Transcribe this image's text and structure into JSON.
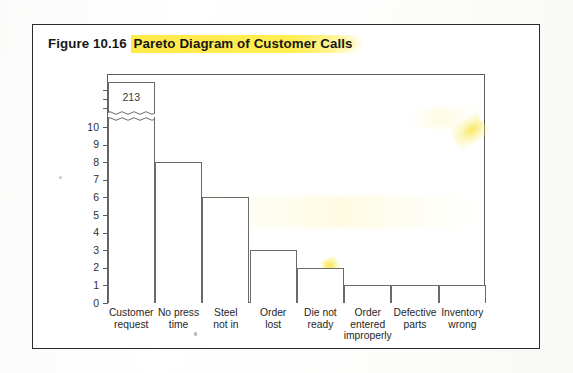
{
  "figure": {
    "label": "Figure 10.16",
    "title_highlighted": "Pareto Diagram of Customer Calls",
    "highlight_color": "#ffe83c"
  },
  "chart_data": {
    "type": "bar",
    "xlabel": "",
    "ylabel": "",
    "categories": [
      "Customer request",
      "No press time",
      "Steel not in",
      "Order lost",
      "Die not ready",
      "Order entered improperly",
      "Defective parts",
      "Inventory wrong"
    ],
    "category_lines": [
      [
        "Customer",
        "request"
      ],
      [
        "No press",
        "time"
      ],
      [
        "Steel",
        "not in"
      ],
      [
        "Order",
        "lost"
      ],
      [
        "Die not",
        "ready"
      ],
      [
        "Order",
        "entered",
        "improperly"
      ],
      [
        "Defective",
        "parts"
      ],
      [
        "Inventory",
        "wrong"
      ]
    ],
    "values": [
      213,
      8,
      6,
      3,
      2,
      1,
      1,
      1
    ],
    "data_labels": [
      "213",
      "",
      "",
      "",
      "",
      "",
      "",
      ""
    ],
    "ylim": [
      0,
      10
    ],
    "yticks": [
      0,
      1,
      2,
      3,
      4,
      5,
      6,
      7,
      8,
      9,
      10
    ],
    "ytick_labels": [
      "0",
      "1",
      "2",
      "3",
      "4",
      "5",
      "6",
      "7",
      "8",
      "9",
      "10"
    ],
    "axis_break": {
      "present": true,
      "style": "wavy-double-line",
      "above_value": 10,
      "note": "First bar (213) is truncated with a squiggle break above the 10 gridline"
    },
    "grid": false,
    "legend": false,
    "bar_fill": "#ffffff",
    "bar_edge": "#6a6a6a"
  }
}
